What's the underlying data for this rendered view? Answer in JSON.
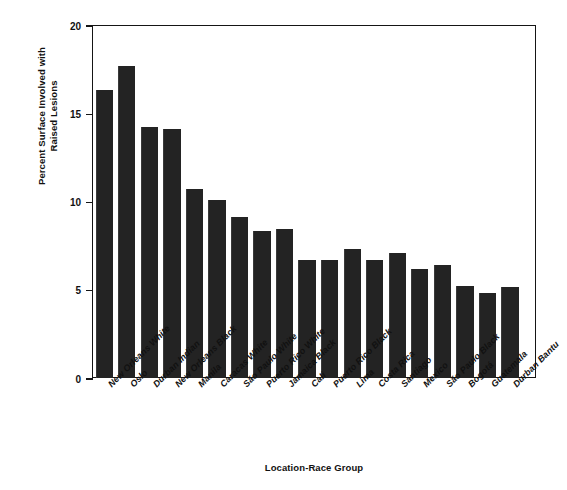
{
  "chart_data": {
    "type": "bar",
    "title": "",
    "subtitle": "",
    "xlabel": "Location-Race Group",
    "ylabel": "Percent Surface Involved with Raised Lesions",
    "ylabel_lines": [
      "Percent Surface Involved with",
      "Raised Lesions"
    ],
    "ylim": [
      0,
      20
    ],
    "yticks": [
      0,
      5,
      10,
      15,
      20
    ],
    "ytick_labels": [
      "0",
      "5",
      "10",
      "15",
      "20"
    ],
    "grid": false,
    "legend": false,
    "legend_position": "none",
    "bar_color": "#232323",
    "axis_color": "#151515",
    "background_color": "#ffffff",
    "categories": [
      "New Orleans White",
      "Oslo",
      "Durban Indian",
      "New Orleans Black",
      "Manila",
      "Caracas White",
      "São Paulo White",
      "Puerto Rico White",
      "Jamaica Black",
      "Cali",
      "Puerto Rico Black",
      "Lima",
      "Costa Rica",
      "Santiago",
      "Mexico",
      "São Paulo Black",
      "Bogotá",
      "Guatemala",
      "Durban Bantu"
    ],
    "values": [
      16.3,
      17.7,
      14.2,
      14.1,
      10.7,
      10.1,
      9.15,
      8.35,
      8.45,
      6.7,
      6.7,
      7.3,
      6.7,
      7.1,
      6.2,
      6.4,
      5.2,
      4.8,
      5.15
    ],
    "series": [
      {
        "name": "Percent Surface Involved with Raised Lesions",
        "values": [
          16.3,
          17.7,
          14.2,
          14.1,
          10.7,
          10.1,
          9.15,
          8.35,
          8.45,
          6.7,
          6.7,
          7.3,
          6.7,
          7.1,
          6.2,
          6.4,
          5.2,
          4.8,
          5.15
        ]
      }
    ]
  }
}
